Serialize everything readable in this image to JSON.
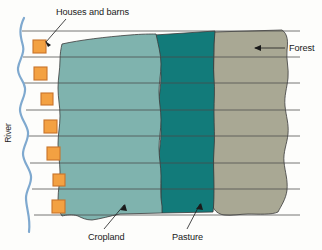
{
  "figure": {
    "type": "land-use-diagram"
  },
  "labels": {
    "houses_and_barns": "Houses and barns",
    "forest": "Forest",
    "river": "River",
    "cropland": "Cropland",
    "pasture": "Pasture"
  },
  "colors": {
    "cropland": "#7fb3ae",
    "pasture": "#127b7a",
    "forest": "#a9a894",
    "house": "#f3a142",
    "house_border": "#c8742a",
    "river": "#7fa9cf",
    "outline": "#3a3a3a",
    "parcel_line": "#4a4a4a",
    "background": "#fdfdfb"
  },
  "counts": {
    "houses": 7,
    "parcel_lines": 8,
    "bands": 3
  },
  "bands": [
    {
      "name": "cropland",
      "label": "Cropland"
    },
    {
      "name": "pasture",
      "label": "Pasture"
    },
    {
      "name": "forest",
      "label": "Forest"
    }
  ],
  "houses": [
    {
      "x": 33,
      "y": 40
    },
    {
      "x": 34,
      "y": 67
    },
    {
      "x": 41,
      "y": 93
    },
    {
      "x": 44,
      "y": 120
    },
    {
      "x": 47,
      "y": 147
    },
    {
      "x": 53,
      "y": 174
    },
    {
      "x": 52,
      "y": 200
    }
  ]
}
